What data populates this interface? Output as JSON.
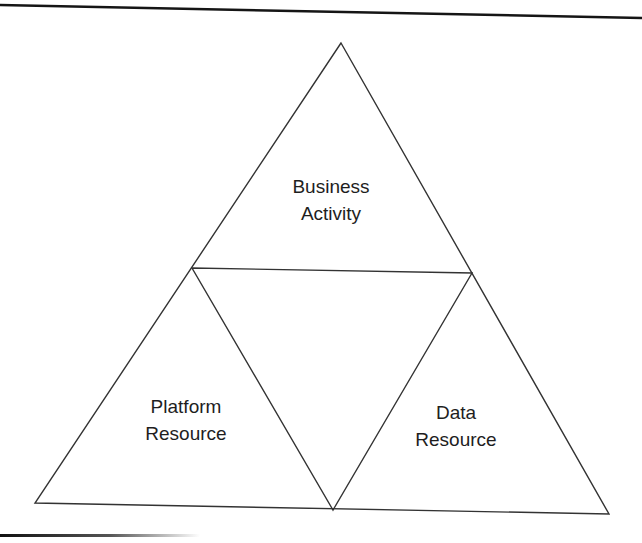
{
  "diagram": {
    "type": "triangle-subdivision",
    "stroke_color": "#333333",
    "background": "#ffffff",
    "sections": [
      {
        "id": "top",
        "lines": [
          "Business",
          "Activity"
        ]
      },
      {
        "id": "bottom-left",
        "lines": [
          "Platform",
          "Resource"
        ]
      },
      {
        "id": "bottom-right",
        "lines": [
          "Data",
          "Resource"
        ]
      }
    ]
  }
}
